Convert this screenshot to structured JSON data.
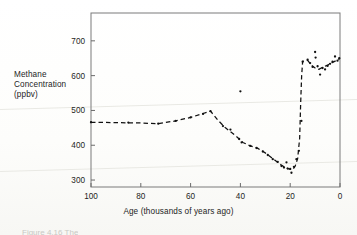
{
  "figure": {
    "y_axis_label_lines": [
      "Methane",
      "Concentration",
      "(ppbv)"
    ],
    "x_axis_title": "Age  (thousands of years ago)",
    "caption_fragment": "Figure 4.16  The"
  },
  "chart_data": {
    "type": "scatter",
    "title": "",
    "xlabel": "Age  (thousands of years ago)",
    "ylabel": "Methane Concentration (ppbv)",
    "xlim": [
      100,
      0
    ],
    "ylim": [
      280,
      780
    ],
    "x_reversed": true,
    "grid": false,
    "legend": null,
    "xticks": [
      100,
      80,
      60,
      40,
      20,
      0
    ],
    "xtick_labels": [
      "100",
      "80",
      "60",
      "40",
      "20",
      "0"
    ],
    "yticks": [
      300,
      400,
      500,
      600,
      700
    ],
    "ytick_labels": [
      "300",
      "400",
      "500",
      "600",
      "700"
    ],
    "series": [
      {
        "name": "Ice-core methane measurements",
        "marker": "point",
        "color": "#111111",
        "points": [
          [
            100.0,
            466
          ],
          [
            85.0,
            465
          ],
          [
            73.0,
            462
          ],
          [
            66.0,
            470
          ],
          [
            60.0,
            480
          ],
          [
            55.0,
            490
          ],
          [
            52.0,
            498
          ],
          [
            47.0,
            455
          ],
          [
            44.0,
            445
          ],
          [
            40.5,
            418
          ],
          [
            40.0,
            555
          ],
          [
            39.5,
            408
          ],
          [
            36.0,
            398
          ],
          [
            33.5,
            392
          ],
          [
            31.0,
            382
          ],
          [
            29.0,
            372
          ],
          [
            27.0,
            360
          ],
          [
            25.0,
            352
          ],
          [
            23.5,
            340
          ],
          [
            22.5,
            336
          ],
          [
            21.5,
            351
          ],
          [
            21.0,
            333
          ],
          [
            20.0,
            332
          ],
          [
            19.5,
            321
          ],
          [
            18.5,
            338
          ],
          [
            17.5,
            360
          ],
          [
            16.5,
            384
          ],
          [
            15.5,
            470
          ],
          [
            15.0,
            640
          ],
          [
            13.0,
            646
          ],
          [
            12.0,
            636
          ],
          [
            11.0,
            625
          ],
          [
            10.0,
            668
          ],
          [
            9.8,
            652
          ],
          [
            9.0,
            627
          ],
          [
            8.0,
            603
          ],
          [
            7.0,
            622
          ],
          [
            6.0,
            618
          ],
          [
            5.0,
            628
          ],
          [
            4.0,
            634
          ],
          [
            3.0,
            640
          ],
          [
            2.0,
            655
          ],
          [
            1.0,
            643
          ],
          [
            0.3,
            650
          ]
        ]
      }
    ],
    "trend_curve": {
      "name": "Smoothed trend",
      "style": "dashed",
      "color": "#111111",
      "points": [
        [
          100.0,
          466
        ],
        [
          90.0,
          465
        ],
        [
          80.0,
          464
        ],
        [
          73.0,
          462
        ],
        [
          66.0,
          470
        ],
        [
          60.0,
          480
        ],
        [
          56.0,
          489
        ],
        [
          52.0,
          498
        ],
        [
          49.0,
          472
        ],
        [
          46.0,
          450
        ],
        [
          42.0,
          428
        ],
        [
          39.0,
          408
        ],
        [
          36.0,
          398
        ],
        [
          33.0,
          391
        ],
        [
          30.0,
          378
        ],
        [
          27.0,
          362
        ],
        [
          24.0,
          345
        ],
        [
          22.0,
          336
        ],
        [
          20.5,
          332
        ],
        [
          19.0,
          330
        ],
        [
          18.0,
          340
        ],
        [
          17.0,
          362
        ],
        [
          16.2,
          420
        ],
        [
          15.8,
          520
        ],
        [
          15.4,
          600
        ],
        [
          15.0,
          641
        ],
        [
          13.0,
          644
        ],
        [
          11.5,
          630
        ],
        [
          10.0,
          622
        ],
        [
          8.5,
          618
        ],
        [
          7.0,
          624
        ],
        [
          5.0,
          630
        ],
        [
          3.0,
          638
        ],
        [
          1.0,
          645
        ],
        [
          0.0,
          650
        ]
      ]
    }
  }
}
